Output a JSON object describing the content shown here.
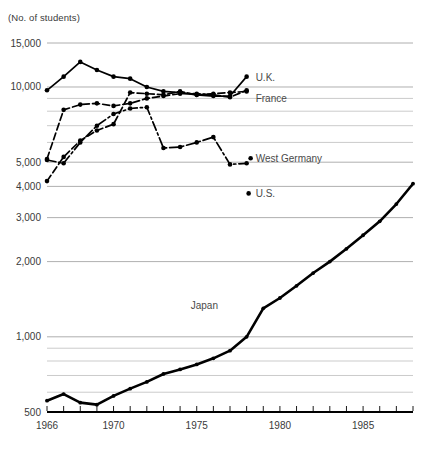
{
  "chart_data": {
    "type": "line",
    "title": "",
    "axis_note": "(No. of students)",
    "xlabel": "",
    "ylabel": "(No. of students)",
    "yscale": "log",
    "ylim": [
      500,
      15000
    ],
    "xlim": [
      1966,
      1988
    ],
    "grid": true,
    "legend_position": "inline-right-of-line-ends",
    "ytick_labels": [
      "15,000",
      "10,000",
      "5,000",
      "4,000",
      "3,000",
      "2,000",
      "1,000",
      "500"
    ],
    "ytick_values": [
      15000,
      10000,
      5000,
      4000,
      3000,
      2000,
      1000,
      500
    ],
    "yminor_values": [
      9000,
      8000,
      7000,
      6000,
      900,
      800,
      700,
      600
    ],
    "xtick_labels": [
      "1966",
      "1970",
      "1975",
      "1980",
      "1985"
    ],
    "xtick_values": [
      1966,
      1970,
      1975,
      1980,
      1985
    ],
    "xticks_all_years": [
      1966,
      1967,
      1968,
      1969,
      1970,
      1971,
      1972,
      1973,
      1974,
      1975,
      1976,
      1977,
      1978,
      1979,
      1980,
      1981,
      1982,
      1983,
      1984,
      1985,
      1986,
      1987,
      1988
    ],
    "series": [
      {
        "name": "Japan",
        "label": "Japan",
        "style": "solid-thick",
        "x": [
          1966,
          1967,
          1968,
          1969,
          1970,
          1971,
          1972,
          1973,
          1974,
          1975,
          1976,
          1977,
          1978,
          1979,
          1980,
          1981,
          1982,
          1983,
          1984,
          1985,
          1986,
          1987,
          1988
        ],
        "values": [
          555,
          590,
          545,
          535,
          580,
          620,
          660,
          710,
          740,
          775,
          820,
          880,
          1000,
          1300,
          1430,
          1600,
          1800,
          2000,
          2250,
          2550,
          2900,
          3400,
          4100
        ]
      },
      {
        "name": "U.K.",
        "label": "U.K.",
        "style": "solid",
        "x": [
          1966,
          1967,
          1968,
          1969,
          1970,
          1971,
          1972,
          1973,
          1974,
          1975,
          1976,
          1977,
          1978
        ],
        "values": [
          9700,
          11000,
          12600,
          11700,
          11000,
          10800,
          10000,
          9600,
          9500,
          9300,
          9200,
          9200,
          11000
        ]
      },
      {
        "name": "France",
        "label": "France",
        "style": "dashed",
        "x": [
          1966,
          1967,
          1968,
          1969,
          1970,
          1971,
          1972,
          1973,
          1974,
          1975,
          1976,
          1977,
          1978
        ],
        "values": [
          5150,
          8100,
          8500,
          8600,
          8400,
          8600,
          9000,
          9200,
          9400,
          9400,
          9300,
          9100,
          9700
        ]
      },
      {
        "name": "West Germany",
        "label": "West Germany",
        "style": "dash-dot",
        "x": [
          1966,
          1967,
          1968,
          1969,
          1970,
          1971,
          1972,
          1973,
          1974,
          1975,
          1976,
          1977,
          1978
        ],
        "values": [
          5100,
          4950,
          6000,
          7000,
          7800,
          8200,
          8300,
          5700,
          5750,
          6000,
          6300,
          4900,
          4950
        ]
      },
      {
        "name": "U.S.",
        "label": "U.S.",
        "style": "dashed",
        "x": [
          1966,
          1967,
          1968,
          1969,
          1970,
          1971,
          1972,
          1973,
          1974,
          1975,
          1976,
          1977,
          1978
        ],
        "values": [
          4200,
          5250,
          6100,
          6700,
          7100,
          9500,
          9400,
          9300,
          9600,
          9300,
          9400,
          9500,
          9600
        ]
      }
    ],
    "series_labels": [
      {
        "name": "U.K.",
        "text": "U.K."
      },
      {
        "name": "France",
        "text": "France"
      },
      {
        "name": "West Germany",
        "text": "West Germany"
      },
      {
        "name": "U.S.",
        "text": "U.S."
      },
      {
        "name": "Japan",
        "text": "Japan"
      }
    ],
    "colors": {
      "line": "#000000",
      "grid": "#b4b4b4",
      "text": "#3a3a3a",
      "background": "#ffffff"
    }
  }
}
